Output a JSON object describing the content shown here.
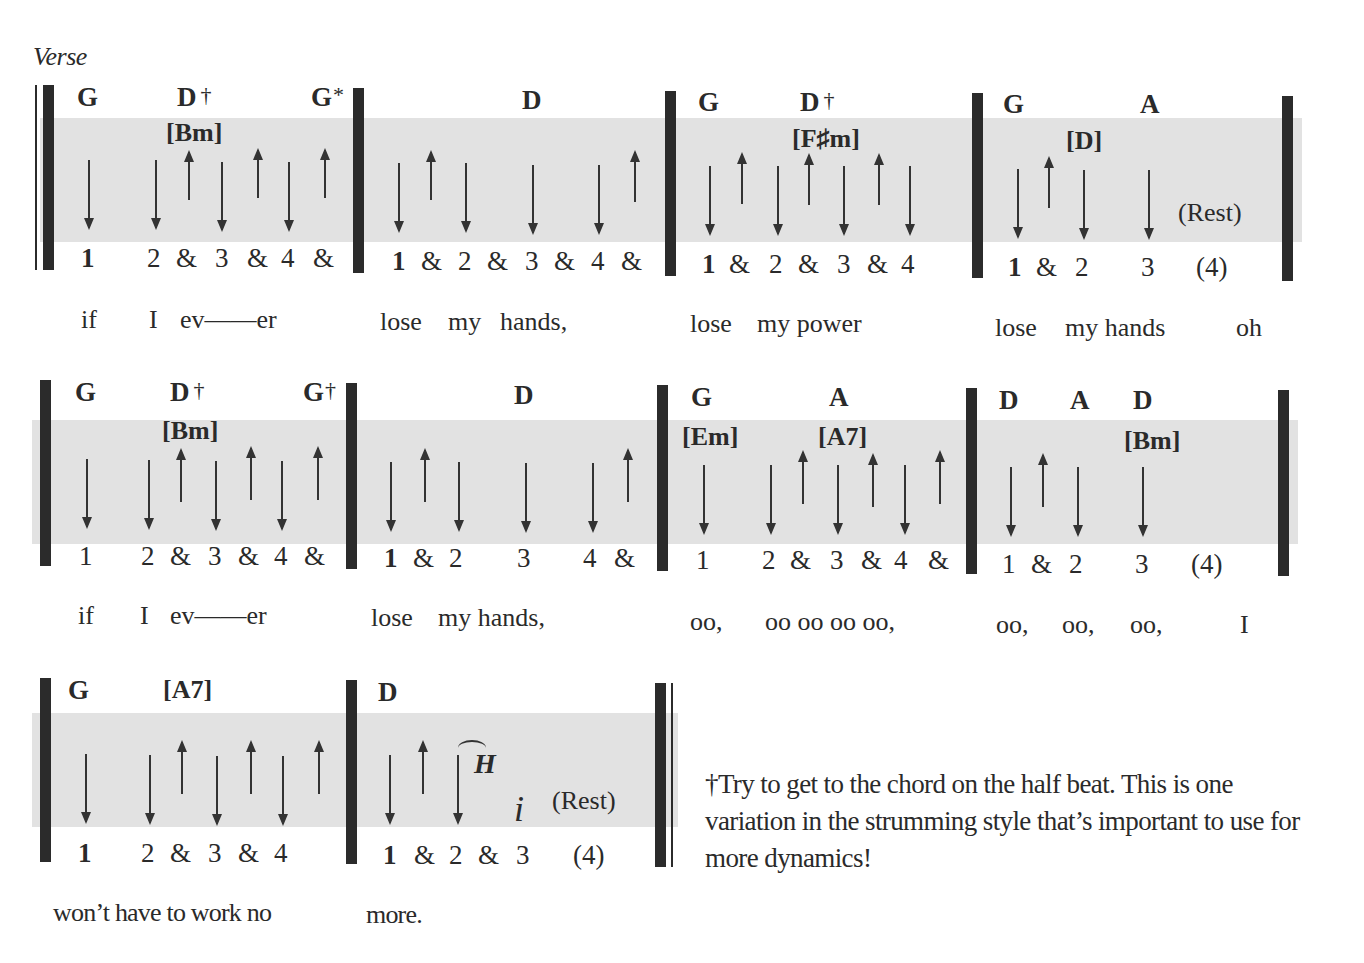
{
  "section_label": "Verse",
  "footnote": "†Try to get to the chord on the half beat. This is one  variation in the strumming style that’s important to use for more dynamics!",
  "rows": [
    {
      "measures": [
        {
          "chords": [
            {
              "name": "G",
              "mark": ""
            },
            {
              "name": "D",
              "mark": "†"
            },
            {
              "name": "G",
              "mark": "*"
            }
          ],
          "alt_chords": [
            "[Bm]"
          ],
          "strums": [
            "down",
            "down",
            "up",
            "down",
            "up",
            "down",
            "up"
          ],
          "beats": [
            "1",
            "2",
            "&",
            "3",
            "&",
            "4",
            "&"
          ],
          "lyrics": [
            "if",
            "I",
            "ev——er"
          ]
        },
        {
          "chords": [
            {
              "name": "D",
              "mark": ""
            }
          ],
          "alt_chords": [],
          "strums": [
            "down",
            "up",
            "down",
            "down",
            "down",
            "up"
          ],
          "beats": [
            "1",
            "&",
            "2",
            "&",
            "3",
            "&",
            "4",
            "&"
          ],
          "lyrics": [
            "lose",
            "my",
            "hands,"
          ]
        },
        {
          "chords": [
            {
              "name": "G",
              "mark": ""
            },
            {
              "name": "D",
              "mark": "†"
            }
          ],
          "alt_chords": [
            "[F♯m]"
          ],
          "strums": [
            "down",
            "up",
            "down",
            "up",
            "down",
            "up",
            "down"
          ],
          "beats": [
            "1",
            "&",
            "2",
            "&",
            "3",
            "&",
            "4"
          ],
          "lyrics": [
            "lose",
            "my power"
          ]
        },
        {
          "chords": [
            {
              "name": "G",
              "mark": ""
            },
            {
              "name": "A",
              "mark": ""
            }
          ],
          "alt_chords": [
            "[D]"
          ],
          "strums": [
            "down",
            "up",
            "down",
            "down"
          ],
          "beats": [
            "1",
            "&",
            "2",
            "3",
            "(4)"
          ],
          "rest": "(Rest)",
          "lyrics": [
            "lose",
            "my hands",
            "oh"
          ]
        }
      ]
    },
    {
      "measures": [
        {
          "chords": [
            {
              "name": "G",
              "mark": ""
            },
            {
              "name": "D",
              "mark": "†"
            },
            {
              "name": "G",
              "mark": "†"
            }
          ],
          "alt_chords": [
            "[Bm]"
          ],
          "strums": [
            "down",
            "down",
            "up",
            "down",
            "up",
            "down",
            "up"
          ],
          "beats": [
            "1",
            "2",
            "&",
            "3",
            "&",
            "4",
            "&"
          ],
          "lyrics": [
            "if",
            "I",
            "ev——er"
          ]
        },
        {
          "chords": [
            {
              "name": "D",
              "mark": ""
            }
          ],
          "alt_chords": [],
          "strums": [
            "down",
            "up",
            "down",
            "down",
            "down",
            "up"
          ],
          "beats": [
            "1",
            "&",
            "2",
            "3",
            "4",
            "&"
          ],
          "lyrics": [
            "lose",
            "my hands,"
          ]
        },
        {
          "chords": [
            {
              "name": "G",
              "mark": ""
            },
            {
              "name": "A",
              "mark": ""
            }
          ],
          "alt_chords": [
            "[Em]",
            "[A7]"
          ],
          "strums": [
            "down",
            "down",
            "up",
            "down",
            "up",
            "down",
            "up"
          ],
          "beats": [
            "1",
            "2",
            "&",
            "3",
            "&",
            "4",
            "&"
          ],
          "lyrics": [
            "oo,",
            "oo oo oo oo,"
          ]
        },
        {
          "chords": [
            {
              "name": "D",
              "mark": ""
            },
            {
              "name": "A",
              "mark": ""
            },
            {
              "name": "D",
              "mark": ""
            }
          ],
          "alt_chords": [
            "[Bm]"
          ],
          "strums": [
            "down",
            "up",
            "down",
            "down"
          ],
          "beats": [
            "1",
            "&",
            "2",
            "3",
            "(4)"
          ],
          "lyrics": [
            "oo,",
            "oo,",
            "oo,",
            "I"
          ]
        }
      ]
    },
    {
      "measures": [
        {
          "chords": [
            {
              "name": "G",
              "mark": ""
            }
          ],
          "alt_chords": [
            "[A7]"
          ],
          "strums": [
            "down",
            "down",
            "up",
            "down",
            "up",
            "down",
            "up"
          ],
          "beats": [
            "1",
            "2",
            "&",
            "3",
            "&",
            "4"
          ],
          "lyrics": [
            "won’t have to work no"
          ]
        },
        {
          "chords": [
            {
              "name": "D",
              "mark": ""
            }
          ],
          "alt_chords": [],
          "strums": [
            "down",
            "up",
            "down"
          ],
          "symbols": [
            "H",
            "i"
          ],
          "rest": "(Rest)",
          "beats": [
            "1",
            "&",
            "2",
            "&",
            "3",
            "(4)"
          ],
          "lyrics": [
            "more."
          ]
        }
      ]
    }
  ]
}
